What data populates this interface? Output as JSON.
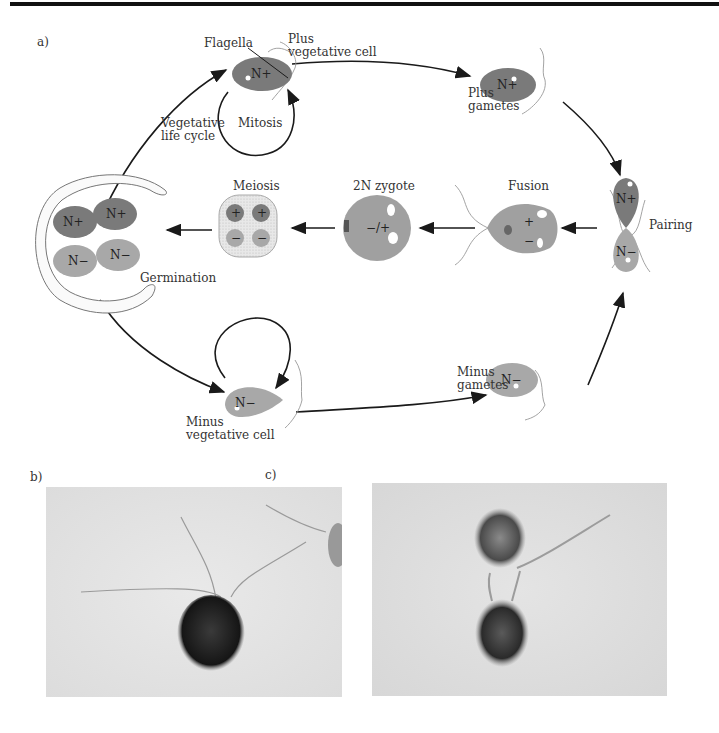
{
  "panels": {
    "a": "a)",
    "b": "b)",
    "c": "c)"
  },
  "labels": {
    "flagella": "Flagella",
    "plus_vegetative_cell": [
      "Plus",
      "vegetative cell"
    ],
    "plus_gametes": [
      "Plus",
      "gametes"
    ],
    "vegetative_life_cycle": [
      "Vegetative",
      "life cycle"
    ],
    "mitosis": "Mitosis",
    "meiosis": "Meiosis",
    "zygote": "2N zygote",
    "fusion": "Fusion",
    "pairing": "Pairing",
    "germination": "Germination",
    "minus_gametes": [
      "Minus",
      "gametes"
    ],
    "minus_vegetative_cell": [
      "Minus",
      "vegetative cell"
    ]
  },
  "cell_marks": {
    "n_plus": "N+",
    "n_minus": "N−",
    "plus": "+",
    "minus": "−",
    "zygote_mark": "−/+"
  },
  "colors": {
    "plus_cell": "#7a7a7a",
    "minus_cell": "#a8a8a8",
    "photo_bg": "#e4e4e4",
    "line": "#1a1a1a"
  }
}
